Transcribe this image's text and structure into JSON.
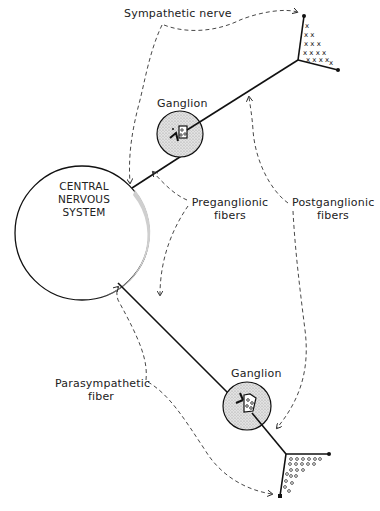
{
  "diagram": {
    "labels": {
      "sympathetic_nerve": "Sympathetic nerve",
      "ganglion_top": "Ganglion",
      "cns_line1": "CENTRAL",
      "cns_line2": "NERVOUS",
      "cns_line3": "SYSTEM",
      "preganglionic_line1": "Preganglionic",
      "preganglionic_line2": "fibers",
      "postganglionic_line1": "Postganglionic",
      "postganglionic_line2": "fibers",
      "ganglion_bottom": "Ganglion",
      "parasympathetic_line1": "Parasympathetic",
      "parasympathetic_line2": "fiber"
    },
    "nodes": [
      {
        "id": "cns",
        "shape": "circle",
        "label": "CENTRAL NERVOUS SYSTEM"
      },
      {
        "id": "sympathetic-ganglion",
        "shape": "circle",
        "fill": "stippled",
        "label": "Ganglion"
      },
      {
        "id": "parasympathetic-ganglion",
        "shape": "circle",
        "fill": "stippled",
        "label": "Ganglion"
      },
      {
        "id": "sympathetic-terminal",
        "marks": "x"
      },
      {
        "id": "parasympathetic-terminal",
        "marks": "o"
      }
    ],
    "edges": [
      {
        "from": "cns",
        "to": "sympathetic-ganglion",
        "type": "preganglionic"
      },
      {
        "from": "sympathetic-ganglion",
        "to": "sympathetic-terminal",
        "type": "postganglionic"
      },
      {
        "from": "cns",
        "to": "parasympathetic-ganglion",
        "type": "preganglionic"
      },
      {
        "from": "parasympathetic-ganglion",
        "to": "parasympathetic-terminal",
        "type": "postganglionic"
      }
    ],
    "colors": {
      "line": "#111111",
      "ganglion_fill": "#d6d6d6",
      "background": "#ffffff"
    }
  }
}
